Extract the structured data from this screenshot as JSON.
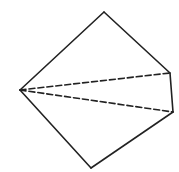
{
  "diagram": {
    "type": "geometric-figure",
    "colors": {
      "stroke": "#222222",
      "background": "#ffffff"
    },
    "vertices": {
      "left": [
        20,
        90
      ],
      "top": [
        104,
        12
      ],
      "right_upper": [
        170,
        73
      ],
      "right_lower": [
        173,
        112
      ],
      "bottom": [
        91,
        168
      ]
    },
    "solid_edges": [
      [
        "left",
        "top"
      ],
      [
        "top",
        "right_upper"
      ],
      [
        "right_upper",
        "right_lower"
      ],
      [
        "right_lower",
        "bottom"
      ],
      [
        "bottom",
        "left"
      ]
    ],
    "dashed_edges": [
      [
        "left",
        "right_upper"
      ],
      [
        "left",
        "right_lower"
      ]
    ]
  }
}
